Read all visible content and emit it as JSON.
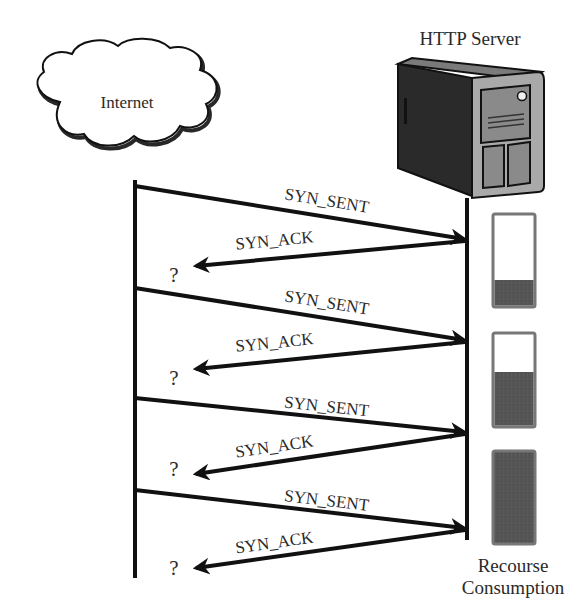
{
  "diagram": {
    "type": "sequence",
    "nodes": {
      "client": {
        "label": "Internet",
        "icon": "cloud-icon"
      },
      "server": {
        "label": "HTTP Server",
        "icon": "server-tower-icon"
      }
    },
    "messages": [
      {
        "label": "SYN_SENT",
        "from": "client",
        "to": "server"
      },
      {
        "label": "SYN_ACK",
        "from": "server",
        "to": "client",
        "response": "?"
      },
      {
        "label": "SYN_SENT",
        "from": "client",
        "to": "server"
      },
      {
        "label": "SYN_ACK",
        "from": "server",
        "to": "client",
        "response": "?"
      },
      {
        "label": "SYN_SENT",
        "from": "client",
        "to": "server"
      },
      {
        "label": "SYN_ACK",
        "from": "server",
        "to": "client",
        "response": "?"
      },
      {
        "label": "SYN_SENT",
        "from": "client",
        "to": "server"
      },
      {
        "label": "SYN_ACK",
        "from": "server",
        "to": "client",
        "response": "?"
      }
    ],
    "resource_meter": {
      "label_line1": "Recourse",
      "label_line2": "Consumption",
      "levels_percent": [
        32,
        60,
        100
      ],
      "fill_color": "#555555",
      "empty_color": "#ffffff",
      "border_color": "#777777"
    }
  },
  "labels": {
    "internet": "Internet",
    "server": "HTTP Server",
    "syn_sent": "SYN_SENT",
    "syn_ack": "SYN_ACK",
    "unknown": "?",
    "resource_line1": "Recourse",
    "resource_line2": "Consumption"
  }
}
